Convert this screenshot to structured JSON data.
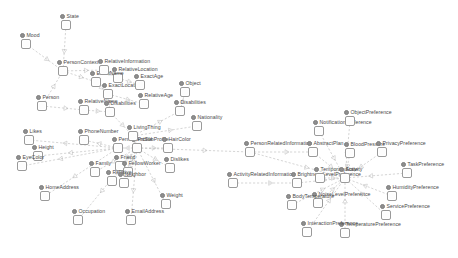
{
  "diagram": {
    "type": "node-link-graph",
    "style": {
      "background": "#ffffff",
      "node_fill": "#fdfdfd",
      "node_stroke": "#9a9a9a",
      "bullet_color": "#8e8e8e",
      "label_color": "#4a4a4a",
      "edge_color": "#b9b9b9"
    },
    "nodes": [
      {
        "id": "state",
        "label": "State",
        "x": 66,
        "y": 25
      },
      {
        "id": "mood",
        "label": "Mood",
        "x": 26,
        "y": 44
      },
      {
        "id": "personcontext",
        "label": "PersonContext",
        "x": 63,
        "y": 71
      },
      {
        "id": "person",
        "label": "Person",
        "x": 42,
        "y": 106
      },
      {
        "id": "likes",
        "label": "Likes",
        "x": 29,
        "y": 140
      },
      {
        "id": "height",
        "label": "Height",
        "x": 38,
        "y": 156
      },
      {
        "id": "eyecolor",
        "label": "EyeColor",
        "x": 22,
        "y": 166
      },
      {
        "id": "homeaddress",
        "label": "HomeAddress",
        "x": 45,
        "y": 196
      },
      {
        "id": "occupation",
        "label": "Occupation",
        "x": 78,
        "y": 220
      },
      {
        "id": "emailaddress",
        "label": "EmailAddress",
        "x": 131,
        "y": 220
      },
      {
        "id": "weight",
        "label": "Weight",
        "x": 166,
        "y": 204
      },
      {
        "id": "phonenumber",
        "label": "PhoneNumber",
        "x": 84,
        "y": 140
      },
      {
        "id": "family",
        "label": "Family",
        "x": 95,
        "y": 172
      },
      {
        "id": "friend",
        "label": "Friend",
        "x": 120,
        "y": 166
      },
      {
        "id": "fellowworker",
        "label": "FellowWorker",
        "x": 128,
        "y": 172
      },
      {
        "id": "relative2",
        "label": "Relative",
        "x": 112,
        "y": 181
      },
      {
        "id": "neighbor",
        "label": "Neighbor",
        "x": 124,
        "y": 183
      },
      {
        "id": "permanentsubprofile",
        "label": "PermanentSubProfile",
        "x": 118,
        "y": 148
      },
      {
        "id": "profile",
        "label": "Profile",
        "x": 137,
        "y": 148
      },
      {
        "id": "livingthing",
        "label": "LivingThing",
        "x": 133,
        "y": 136
      },
      {
        "id": "haircolor",
        "label": "HairColor",
        "x": 168,
        "y": 148
      },
      {
        "id": "dislikes",
        "label": "Dislikes",
        "x": 170,
        "y": 168
      },
      {
        "id": "relativename",
        "label": "RelativeName",
        "x": 84,
        "y": 110
      },
      {
        "id": "exactlocation",
        "label": "ExactLocation",
        "x": 108,
        "y": 94
      },
      {
        "id": "relativelocation",
        "label": "RelativeLocation",
        "x": 118,
        "y": 78
      },
      {
        "id": "exactage",
        "label": "ExactAge",
        "x": 140,
        "y": 85
      },
      {
        "id": "relativeage",
        "label": "RelativeAge",
        "x": 144,
        "y": 104
      },
      {
        "id": "exactname",
        "label": "ExactName",
        "x": 96,
        "y": 82
      },
      {
        "id": "relativeinfo",
        "label": "RelativeInformation",
        "x": 104,
        "y": 70
      },
      {
        "id": "disabilities",
        "label": "Disabilities",
        "x": 110,
        "y": 112
      },
      {
        "id": "object",
        "label": "Object",
        "x": 185,
        "y": 92
      },
      {
        "id": "disabilities2",
        "label": "Disabilities",
        "x": 180,
        "y": 111
      },
      {
        "id": "nationality",
        "label": "Nationality",
        "x": 197,
        "y": 126
      },
      {
        "id": "personrelatedinformation",
        "label": "PersonRelatedInformation",
        "x": 250,
        "y": 152
      },
      {
        "id": "activityrelatedinformation",
        "label": "ActivityRelatedInformation",
        "x": 233,
        "y": 183
      },
      {
        "id": "abstractplan",
        "label": "AbstractPlan",
        "x": 313,
        "y": 152
      },
      {
        "id": "notificationpreference",
        "label": "NotificationPreference",
        "x": 319,
        "y": 131
      },
      {
        "id": "objectpreference",
        "label": "ObjectPreference",
        "x": 350,
        "y": 121
      },
      {
        "id": "bloodpressure",
        "label": "BloodPressure",
        "x": 350,
        "y": 153
      },
      {
        "id": "privacypreference",
        "label": "PrivacyPreference",
        "x": 382,
        "y": 152
      },
      {
        "id": "taskpreference",
        "label": "TaskPreference",
        "x": 407,
        "y": 173
      },
      {
        "id": "humiditypreference",
        "label": "HumidityPreference",
        "x": 392,
        "y": 196
      },
      {
        "id": "servicepreference",
        "label": "ServicePreference",
        "x": 386,
        "y": 215
      },
      {
        "id": "temperaturepreference",
        "label": "TemperaturePreference",
        "x": 345,
        "y": 233
      },
      {
        "id": "interactionpreference",
        "label": "InteractionPreference",
        "x": 307,
        "y": 232
      },
      {
        "id": "noiselevelpreference",
        "label": "NoiseLevelPreference",
        "x": 318,
        "y": 203
      },
      {
        "id": "bodytemperature",
        "label": "BodyTemperature",
        "x": 292,
        "y": 205
      },
      {
        "id": "brightnesslevelpreference",
        "label": "BrightnessLevelPreference",
        "x": 297,
        "y": 183
      },
      {
        "id": "temporarystate",
        "label": "TemporaryState",
        "x": 320,
        "y": 178
      },
      {
        "id": "activity",
        "label": "Activity",
        "x": 345,
        "y": 178
      }
    ],
    "edges": [
      {
        "from": "state",
        "to": "personcontext"
      },
      {
        "from": "mood",
        "to": "personcontext"
      },
      {
        "from": "personcontext",
        "to": "exactname"
      },
      {
        "from": "personcontext",
        "to": "relativeinfo"
      },
      {
        "from": "person",
        "to": "relativename"
      },
      {
        "from": "person",
        "to": "personcontext"
      },
      {
        "from": "exactname",
        "to": "exactlocation"
      },
      {
        "from": "relativeinfo",
        "to": "relativelocation"
      },
      {
        "from": "relativelocation",
        "to": "exactage"
      },
      {
        "from": "exactlocation",
        "to": "relativeage"
      },
      {
        "from": "exactlocation",
        "to": "disabilities"
      },
      {
        "from": "relativename",
        "to": "disabilities"
      },
      {
        "from": "disabilities",
        "to": "livingthing"
      },
      {
        "from": "livingthing",
        "to": "profile"
      },
      {
        "from": "profile",
        "to": "permanentsubprofile"
      },
      {
        "from": "profile",
        "to": "haircolor"
      },
      {
        "from": "profile",
        "to": "dislikes"
      },
      {
        "from": "profile",
        "to": "weight"
      },
      {
        "from": "profile",
        "to": "emailaddress"
      },
      {
        "from": "profile",
        "to": "occupation"
      },
      {
        "from": "profile",
        "to": "friend"
      },
      {
        "from": "profile",
        "to": "fellowworker"
      },
      {
        "from": "profile",
        "to": "relative2"
      },
      {
        "from": "profile",
        "to": "neighbor"
      },
      {
        "from": "profile",
        "to": "family"
      },
      {
        "from": "permanentsubprofile",
        "to": "phonenumber"
      },
      {
        "from": "permanentsubprofile",
        "to": "height"
      },
      {
        "from": "permanentsubprofile",
        "to": "eyecolor"
      },
      {
        "from": "permanentsubprofile",
        "to": "likes"
      },
      {
        "from": "permanentsubprofile",
        "to": "homeaddress"
      },
      {
        "from": "livingthing",
        "to": "nationality"
      },
      {
        "from": "livingthing",
        "to": "disabilities2"
      },
      {
        "from": "disabilities2",
        "to": "object"
      },
      {
        "from": "profile",
        "to": "personrelatedinformation"
      },
      {
        "from": "personrelatedinformation",
        "to": "abstractplan"
      },
      {
        "from": "activityrelatedinformation",
        "to": "brightnesslevelpreference"
      },
      {
        "from": "abstractplan",
        "to": "activity"
      },
      {
        "from": "notificationpreference",
        "to": "activity"
      },
      {
        "from": "objectpreference",
        "to": "activity"
      },
      {
        "from": "bloodpressure",
        "to": "activity"
      },
      {
        "from": "privacypreference",
        "to": "activity"
      },
      {
        "from": "taskpreference",
        "to": "activity"
      },
      {
        "from": "humiditypreference",
        "to": "activity"
      },
      {
        "from": "servicepreference",
        "to": "activity"
      },
      {
        "from": "temperaturepreference",
        "to": "activity"
      },
      {
        "from": "interactionpreference",
        "to": "activity"
      },
      {
        "from": "noiselevelpreference",
        "to": "activity"
      },
      {
        "from": "bodytemperature",
        "to": "activity"
      },
      {
        "from": "brightnesslevelpreference",
        "to": "activity"
      },
      {
        "from": "temporarystate",
        "to": "activity"
      },
      {
        "from": "personrelatedinformation",
        "to": "activity"
      }
    ]
  }
}
